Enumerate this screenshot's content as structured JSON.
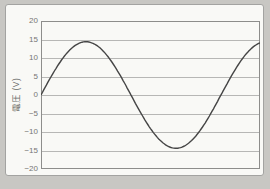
{
  "chart_data": {
    "type": "line",
    "title": "",
    "xlabel": "",
    "ylabel": "電圧 (V)",
    "ylim": [
      -20,
      20
    ],
    "yticks": [
      20,
      15,
      10,
      5,
      0,
      -5,
      -10,
      -15,
      -20
    ],
    "ytick_labels": [
      "20",
      "15",
      "10",
      "5",
      "0",
      "−5",
      "−10",
      "−15",
      "−20"
    ],
    "xticks": [],
    "grid": "horizontal",
    "legend": "none",
    "series": [
      {
        "name": "voltage-waveform",
        "waveform": "sine",
        "amplitude_v": 14.4,
        "start_phase_deg": 0,
        "cycles_shown": 1.217,
        "sampled_points": {
          "x_fraction": [
            0,
            0.1,
            0.2,
            0.3,
            0.4,
            0.5,
            0.6,
            0.7,
            0.8,
            0.9,
            1.0
          ],
          "voltage_v": [
            0,
            10.0,
            14.4,
            10.8,
            1.2,
            -9.1,
            -14.3,
            -11.6,
            -2.4,
            8.1,
            14.1
          ]
        }
      }
    ],
    "colors": {
      "page_bg": "#c8c7c3",
      "panel_bg": "#f9f9f6",
      "panel_border": "#a3a3a1",
      "plot_border": "#8d8d8b",
      "gridline": "#b7b7b5",
      "curve": "#454545",
      "tick_text": "#767674",
      "axis_label_text": "#6b6b69"
    }
  }
}
